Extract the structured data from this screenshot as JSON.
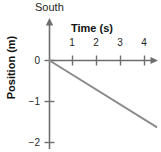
{
  "chart_data": {
    "type": "line",
    "title": "",
    "subtitle": "",
    "xlabel": "Time (s)",
    "ylabel": "Position (m)",
    "direction_label": "South",
    "xlim": [
      0,
      4.6
    ],
    "ylim": [
      -2.2,
      0.25
    ],
    "xticks": [
      1,
      2,
      3,
      4
    ],
    "xtick_labels": [
      "1",
      "2",
      "3",
      "4"
    ],
    "yticks": [
      0,
      -1,
      -2
    ],
    "ytick_labels": [
      "0",
      "−1",
      "−2"
    ],
    "grid": false,
    "legend": false,
    "legend_position": "none",
    "axis_arrows": {
      "x_axis_arrow": "right-arrow-icon",
      "y_axis_arrow": "up-arrow-icon"
    },
    "series": [
      {
        "name": "position",
        "color": "#8c8c8c",
        "line_width": 2,
        "x": [
          0,
          1,
          2,
          3,
          4,
          4.45
        ],
        "y": [
          0,
          -0.365,
          -0.73,
          -1.1,
          -1.46,
          -1.62
        ]
      }
    ],
    "annotations": [],
    "slope": -0.365,
    "slope_units": "m/s",
    "axis_color": "#6e6e6e",
    "text_color": "#1a1a1a",
    "background_color": "#ffffff"
  }
}
